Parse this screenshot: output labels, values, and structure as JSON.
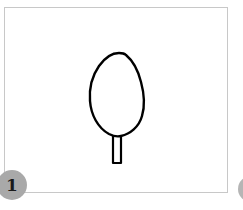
{
  "panel": {
    "step_number": "1",
    "next_step_number": "",
    "frame_border_color": "#c8c8c8",
    "badge_color": "#a9a9a9",
    "stroke_color": "#000000"
  },
  "drawing": {
    "subject": "tree-outline",
    "crown": "egg-shaped oval",
    "trunk": "narrow rectangle"
  }
}
